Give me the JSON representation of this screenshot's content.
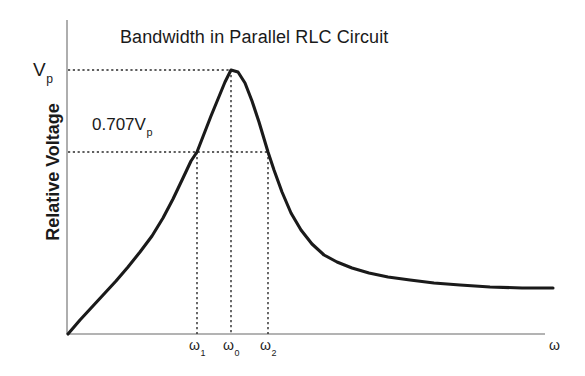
{
  "chart_data": {
    "type": "line",
    "title": "Bandwidth in Parallel RLC Circuit",
    "xlabel": "ω",
    "ylabel": "Relative Voltage",
    "grid": false,
    "legend": null,
    "axis_color": "#808080",
    "curve_color": "#1a1a1a",
    "guide_color": "#333333",
    "annotations": {
      "peak_label": "V",
      "peak_label_sub": "p",
      "half_power_label": "0.707V",
      "half_power_label_sub": "p"
    },
    "x_ticks": [
      {
        "label": "ω",
        "sub": "1",
        "x": 197
      },
      {
        "label": "ω",
        "sub": "0",
        "x": 231
      },
      {
        "label": "ω",
        "sub": "2",
        "x": 268
      }
    ],
    "y_levels": [
      {
        "name": "Vp",
        "value": 1.0,
        "y_px": 70
      },
      {
        "name": "0.707Vp",
        "value": 0.707,
        "y_px": 152
      }
    ],
    "axes_px": {
      "x0": 67,
      "y0": 334,
      "x_max": 545,
      "y_top": 20
    },
    "series": [
      {
        "name": "Relative Voltage vs ω",
        "points": [
          [
            68,
            334
          ],
          [
            80,
            320
          ],
          [
            92,
            307
          ],
          [
            104,
            294
          ],
          [
            116,
            281
          ],
          [
            128,
            267
          ],
          [
            140,
            252
          ],
          [
            152,
            236
          ],
          [
            163,
            218
          ],
          [
            173,
            199
          ],
          [
            183,
            178
          ],
          [
            191,
            161
          ],
          [
            197,
            152
          ],
          [
            204,
            134
          ],
          [
            211,
            116
          ],
          [
            218,
            99
          ],
          [
            225,
            82
          ],
          [
            231,
            70
          ],
          [
            238,
            72
          ],
          [
            245,
            83
          ],
          [
            252,
            101
          ],
          [
            259,
            122
          ],
          [
            265,
            142
          ],
          [
            268,
            152
          ],
          [
            274,
            170
          ],
          [
            282,
            192
          ],
          [
            291,
            213
          ],
          [
            301,
            230
          ],
          [
            312,
            244
          ],
          [
            324,
            255
          ],
          [
            337,
            262
          ],
          [
            352,
            268
          ],
          [
            369,
            273
          ],
          [
            388,
            277
          ],
          [
            410,
            280
          ],
          [
            434,
            283
          ],
          [
            460,
            285
          ],
          [
            490,
            287
          ],
          [
            522,
            288
          ],
          [
            553,
            288
          ]
        ]
      }
    ]
  }
}
